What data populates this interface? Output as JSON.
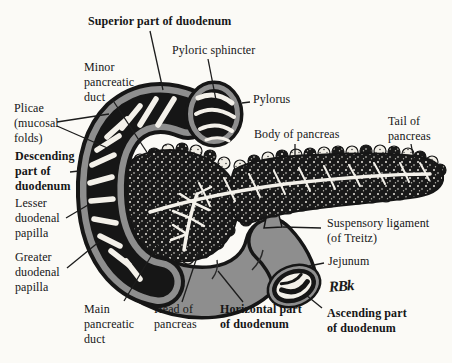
{
  "figure": {
    "type": "anatomical line illustration",
    "background": "#fbfaf6",
    "ink": "#161616",
    "organ_gray": "#8e8e8e",
    "paper_white": "#f4f1ea",
    "signature": "RBk"
  },
  "labels": [
    {
      "id": "superior-part-of-duodenum",
      "text": "Superior part of duodenum",
      "bold": true
    },
    {
      "id": "pyloric-sphincter",
      "text": "Pyloric sphincter",
      "bold": false
    },
    {
      "id": "minor-pancreatic-duct",
      "text": "Minor\npancreatic\nduct",
      "bold": false
    },
    {
      "id": "plicae-mucosal-folds",
      "text": "Plicae\n(mucosal\nfolds)",
      "bold": false
    },
    {
      "id": "descending-part-of-duodenum",
      "text": "Descending\npart of\nduodenum",
      "bold": true
    },
    {
      "id": "lesser-duodenal-papilla",
      "text": "Lesser\nduodenal\npapilla",
      "bold": false
    },
    {
      "id": "greater-duodenal-papilla",
      "text": "Greater\nduodenal\npapilla",
      "bold": false
    },
    {
      "id": "main-pancreatic-duct",
      "text": "Main\npancreatic\nduct",
      "bold": false
    },
    {
      "id": "head-of-pancreas",
      "text": "Head of\npancreas",
      "bold": false
    },
    {
      "id": "horizontal-part-of-duodenum",
      "text": "Horizontal part\nof duodenum",
      "bold": true
    },
    {
      "id": "ascending-part-of-duodenum",
      "text": "Ascending part\nof duodenum",
      "bold": true
    },
    {
      "id": "jejunum",
      "text": "Jejunum",
      "bold": false
    },
    {
      "id": "suspensory-ligament",
      "text": "Suspensory ligament\n(of Treitz)",
      "bold": false
    },
    {
      "id": "body-of-pancreas",
      "text": "Body of pancreas",
      "bold": false
    },
    {
      "id": "tail-of-pancreas",
      "text": "Tail of\npancreas",
      "bold": false
    },
    {
      "id": "pylorus",
      "text": "Pylorus",
      "bold": false
    }
  ]
}
